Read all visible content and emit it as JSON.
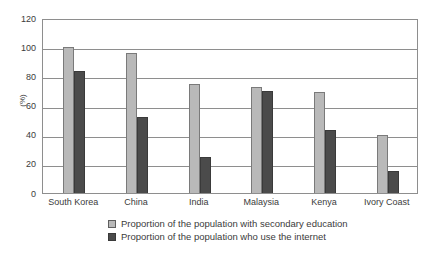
{
  "chart_data": {
    "type": "bar",
    "title": "",
    "subtitle": "",
    "xlabel": "",
    "ylabel": "(%)",
    "ylim": [
      0,
      120
    ],
    "yticks": [
      0,
      20,
      40,
      60,
      80,
      100,
      120
    ],
    "ytick_labels": [
      "0",
      "20",
      "40",
      "60",
      "80",
      "100",
      "120"
    ],
    "grid": true,
    "legend_position": "bottom",
    "categories": [
      "South Korea",
      "China",
      "India",
      "Malaysia",
      "Kenya",
      "Ivory Coast"
    ],
    "series": [
      {
        "name": "Proportion of the population with secondary education",
        "color": "#b9b9b9",
        "values": [
          100,
          96,
          75,
          73,
          69,
          40
        ]
      },
      {
        "name": "Proportion of the population who use the internet",
        "color": "#4b4b4b",
        "values": [
          84,
          52,
          25,
          70,
          43,
          15
        ]
      }
    ]
  },
  "legend": {
    "items": [
      {
        "label": "Proportion of the population with secondary education",
        "swatch": "light"
      },
      {
        "label": "Proportion of the population who use the internet",
        "swatch": "dark"
      }
    ]
  },
  "colors": {
    "series_light": "#b9b9b9",
    "series_dark": "#4b4b4b",
    "axis": "#8e8e8e",
    "text": "#3b3b3b",
    "background": "#ffffff"
  }
}
